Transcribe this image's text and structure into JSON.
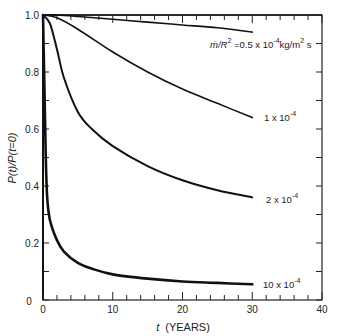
{
  "chart_data": {
    "type": "line",
    "title": "",
    "xlabel": "t (YEARS)",
    "ylabel": "P(t)/P(t=0)",
    "xlim": [
      0,
      40
    ],
    "ylim": [
      0,
      1.0
    ],
    "x_ticks": [
      "0",
      "10",
      "20",
      "30",
      "40"
    ],
    "y_ticks": [
      "0",
      "0.2",
      "0.4",
      "0.6",
      "0.8",
      "1.0"
    ],
    "grid": false,
    "legend_position": "inline labels at right end of curves",
    "parameter": "ṁ/R² (kg/m²s)",
    "series": [
      {
        "name": "ṁ/R² = 0.5 x 10^-4 kg/m² s",
        "label": "ṁ/R² = 0.5 x 10⁻⁴ kg/m² s",
        "x": [
          0,
          2,
          5,
          10,
          15,
          20,
          25,
          30
        ],
        "values": [
          1.0,
          1.0,
          0.995,
          0.985,
          0.975,
          0.965,
          0.955,
          0.94
        ]
      },
      {
        "name": "1 x 10^-4",
        "label": "1 x 10⁻⁴",
        "x": [
          0,
          2,
          5,
          10,
          15,
          20,
          25,
          30
        ],
        "values": [
          1.0,
          0.99,
          0.95,
          0.87,
          0.8,
          0.74,
          0.69,
          0.64
        ]
      },
      {
        "name": "2 x 10^-4",
        "label": "2 x 10⁻⁴",
        "x": [
          0,
          1,
          2,
          3,
          5,
          7,
          10,
          15,
          20,
          25,
          30
        ],
        "values": [
          1.0,
          0.97,
          0.88,
          0.78,
          0.66,
          0.6,
          0.54,
          0.47,
          0.42,
          0.385,
          0.36
        ]
      },
      {
        "name": "10 x 10^-4",
        "label": "10 x 10⁻⁴",
        "x": [
          0,
          0.2,
          0.4,
          0.6,
          1,
          2,
          3,
          5,
          7,
          10,
          15,
          20,
          25,
          30
        ],
        "values": [
          1.0,
          0.75,
          0.5,
          0.36,
          0.28,
          0.21,
          0.17,
          0.13,
          0.11,
          0.09,
          0.075,
          0.065,
          0.06,
          0.055
        ]
      }
    ]
  },
  "axes": {
    "x_label_var": "t",
    "x_label_unit": "(YEARS)",
    "y_label": "P(t)/P(t=0)",
    "origin_label": "0"
  },
  "labels": {
    "s0_prefix": "ṁ/R",
    "s0_sup1": "2",
    "s0_mid": " =0.5 x 10",
    "s0_sup2": "-4",
    "s0_unit": "kg/m",
    "s0_sup3": "2",
    "s0_end": " s",
    "s1_main": "1 x 10",
    "s1_sup": "-4",
    "s2_main": "2 x 10",
    "s2_sup": "-4",
    "s3_main": "10 x 10",
    "s3_sup": "-4"
  }
}
